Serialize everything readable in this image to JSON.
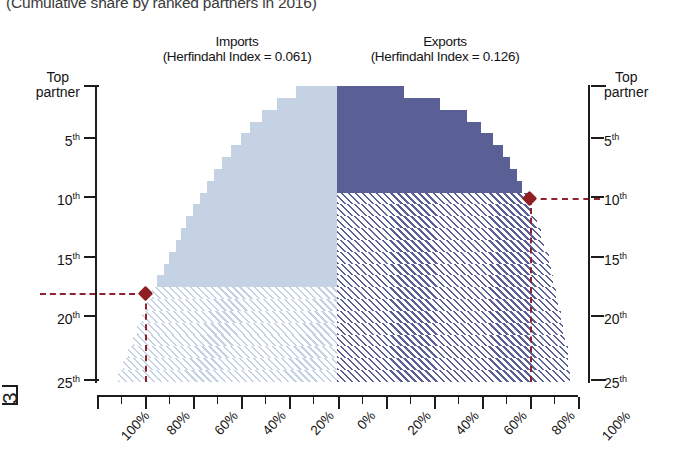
{
  "subtitle": "(Cumulative share by ranked partners in 2016)",
  "page_number": "3",
  "panels": {
    "imports": {
      "name": "Imports",
      "herfindahl_label": "(Herfindahl Index = 0.061)"
    },
    "exports": {
      "name": "Exports",
      "herfindahl_label": "(Herfindahl Index = 0.126)"
    }
  },
  "axes": {
    "y_labels": [
      "Top partner",
      "5th",
      "10th",
      "15th",
      "20th",
      "25th"
    ],
    "y_label_top_line1": "Top",
    "y_label_top_line2": "partner",
    "y_ranks": [
      1,
      5,
      10,
      15,
      20,
      25
    ],
    "x_labels": [
      "100%",
      "80%",
      "60%",
      "40%",
      "20%",
      "0%",
      "20%",
      "40%",
      "60%",
      "80%",
      "100%"
    ],
    "x_values": [
      -100,
      -80,
      -60,
      -40,
      -20,
      0,
      20,
      40,
      60,
      80,
      100
    ]
  },
  "colors": {
    "imports_solid": "#c5d2e4",
    "imports_hatch": "#c5d2e4",
    "exports_solid": "#5a5f96",
    "exports_hatch": "#5a5f96",
    "marker": "#8f1f22",
    "guide_line": "#8f2230",
    "axis": "#1c1c1c"
  },
  "highlights": {
    "imports": {
      "rank": 17.5,
      "cumulative_share": 80,
      "marker_label": "80%"
    },
    "exports": {
      "rank": 9.5,
      "cumulative_share": 80,
      "marker_label": "80%"
    }
  },
  "chart_data": {
    "type": "bar",
    "title": "",
    "subtitle": "(Cumulative share by ranked partners in 2016)",
    "orientation": "horizontal-diverging",
    "xlabel": "",
    "ylabel": "Partner rank",
    "xlim": [
      -100,
      100
    ],
    "ylim": [
      25.5,
      0.5
    ],
    "grid": false,
    "legend": "none",
    "categories": [
      "Top partner",
      "2nd",
      "3rd",
      "4th",
      "5th",
      "6th",
      "7th",
      "8th",
      "9th",
      "10th",
      "11th",
      "12th",
      "13th",
      "14th",
      "15th",
      "16th",
      "17th",
      "18th",
      "19th",
      "20th",
      "21st",
      "22nd",
      "23rd",
      "24th",
      "25th"
    ],
    "series": [
      {
        "name": "Imports",
        "herfindahl_index": 0.061,
        "direction": "left",
        "values": [
          17,
          25,
          31,
          36,
          40,
          44,
          48,
          51,
          54,
          57,
          60,
          63,
          65,
          67,
          70,
          72,
          75,
          77,
          79,
          81,
          83,
          85,
          87,
          89,
          91
        ]
      },
      {
        "name": "Exports",
        "herfindahl_index": 0.126,
        "direction": "right",
        "values": [
          28,
          43,
          54,
          60,
          65,
          69,
          72,
          75,
          77,
          79,
          81,
          83,
          85,
          86,
          88,
          89,
          90,
          91,
          92,
          93,
          94,
          95,
          96,
          96,
          97
        ]
      }
    ],
    "annotations": [
      {
        "series": "Imports",
        "text": "80% of imports reached at about the 18th partner",
        "rank": 17.5,
        "value": 80
      },
      {
        "series": "Exports",
        "text": "80% of exports reached at about the 10th partner",
        "rank": 9.5,
        "value": 80
      }
    ]
  }
}
